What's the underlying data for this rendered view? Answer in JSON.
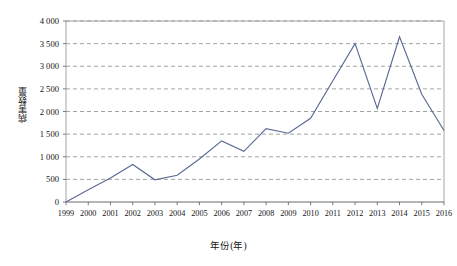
{
  "chart_data": {
    "type": "line",
    "title": "",
    "xlabel": "年份(年)",
    "ylabel": "病害数量",
    "categories": [
      "1999",
      "2000",
      "2001",
      "2002",
      "2003",
      "2004",
      "2005",
      "2006",
      "2007",
      "2008",
      "2009",
      "2010",
      "2011",
      "2012",
      "2013",
      "2014",
      "2015",
      "2016"
    ],
    "values": [
      0,
      270,
      530,
      830,
      490,
      590,
      950,
      1350,
      1120,
      1620,
      1520,
      1850,
      2680,
      3500,
      2070,
      3650,
      2380,
      1580
    ],
    "series": [
      {
        "name": "病害数量",
        "color": "#5a6a96",
        "values": [
          0,
          270,
          530,
          830,
          490,
          590,
          950,
          1350,
          1120,
          1620,
          1520,
          1850,
          2680,
          3500,
          2070,
          3650,
          2380,
          1580
        ]
      }
    ],
    "ylim": [
      0,
      4000
    ],
    "ytick_values": [
      0,
      500,
      1000,
      1500,
      2000,
      2500,
      3000,
      3500,
      4000
    ],
    "ytick_labels": [
      "0",
      "500",
      "1 000",
      "1 500",
      "2 000",
      "2 500",
      "3 000",
      "3 500",
      "4 000"
    ],
    "grid": true,
    "grid_style": "dashed-horizontal",
    "legend": "none",
    "line_color": "#5a6a96",
    "markers": "none",
    "background_color": "#ffffff",
    "frame_color": "#9a9a9a"
  }
}
